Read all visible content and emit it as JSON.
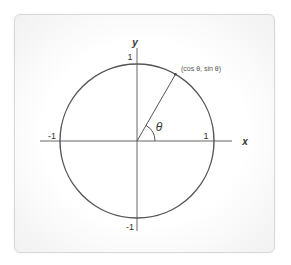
{
  "diagram": {
    "axes": {
      "x_label": "x",
      "y_label": "y"
    },
    "ticks": {
      "x_pos": "1",
      "x_neg": "-1",
      "y_pos": "1",
      "y_neg": "-1"
    },
    "point_label": "(cos  θ, sin  θ)",
    "angle_label": "θ",
    "angle_degrees": 60,
    "colors": {
      "stroke": "#555555",
      "axis": "#666666",
      "card_border": "#d8d8d8"
    }
  }
}
